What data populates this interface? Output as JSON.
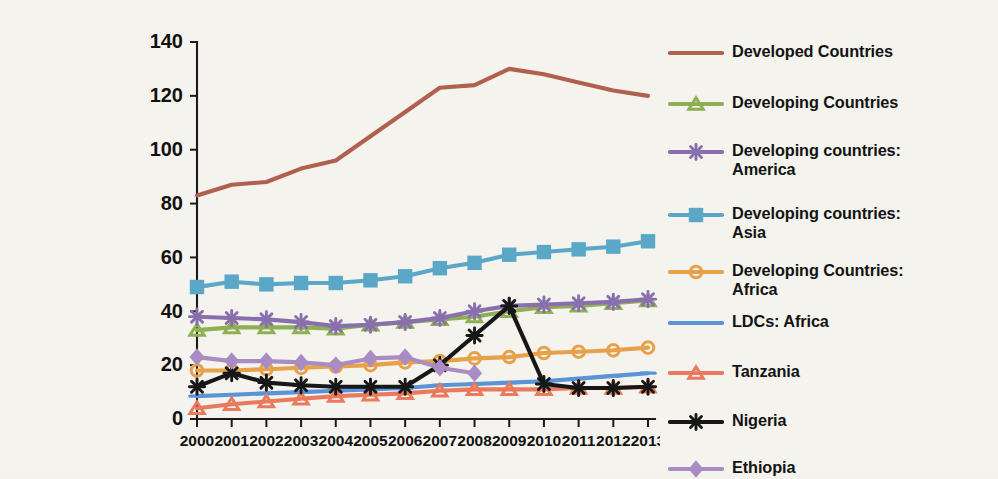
{
  "chart_data": {
    "type": "line",
    "title": "",
    "subtitle": "",
    "xlabel": "",
    "ylabel": "",
    "xlim": [
      2000,
      2013
    ],
    "ylim": [
      0,
      140
    ],
    "yticks": [
      0,
      20,
      40,
      60,
      80,
      100,
      120,
      140
    ],
    "grid": false,
    "legend_position": "right",
    "categories": [
      "2000",
      "2001",
      "2002",
      "2003",
      "2004",
      "2005",
      "2006",
      "2007",
      "2008",
      "2009",
      "2010",
      "2011",
      "2012",
      "2013"
    ],
    "series": [
      {
        "name": "Developed Countries",
        "color": "#b0604f",
        "marker": "none",
        "values": [
          83,
          87,
          88,
          93,
          96,
          105,
          114,
          123,
          124,
          130,
          128,
          125,
          122,
          120
        ]
      },
      {
        "name": "Developing Countries",
        "color": "#8faf54",
        "marker": "triangle",
        "values": [
          33,
          34,
          34,
          34,
          33.5,
          35,
          36,
          37,
          38,
          40,
          41.5,
          42,
          43,
          44
        ]
      },
      {
        "name": "Developing countries:\nAmerica",
        "color": "#8a6fae",
        "marker": "star",
        "values": [
          38,
          37.5,
          37,
          36,
          34.5,
          35,
          36,
          37.5,
          40,
          42,
          42.5,
          43,
          43.5,
          44.5
        ]
      },
      {
        "name": "Developing countries:\nAsia",
        "color": "#5aa7c8",
        "marker": "square",
        "values": [
          49,
          51,
          50,
          50.5,
          50.5,
          51.5,
          53,
          56,
          58,
          61,
          62,
          63,
          64,
          66
        ]
      },
      {
        "name": "Developing Countries:\nAfrica",
        "color": "#e6a14a",
        "marker": "circle",
        "values": [
          18,
          18,
          18.5,
          19,
          19.5,
          20,
          21,
          21.5,
          22.5,
          23,
          24.5,
          25,
          25.5,
          26.5
        ]
      },
      {
        "name": "LDCs: Africa",
        "color": "#5b94d6",
        "marker": "line",
        "values": [
          8.5,
          9,
          9.5,
          10,
          10.5,
          11,
          11.5,
          12.5,
          13,
          13.5,
          14,
          15,
          16,
          17
        ]
      },
      {
        "name": "Tanzania",
        "color": "#ea7a5d",
        "marker": "triangle",
        "values": [
          4,
          5.5,
          6.5,
          7.5,
          8.5,
          9,
          9.5,
          10.5,
          11,
          11,
          11,
          11.5,
          11.5,
          12
        ]
      },
      {
        "name": "Nigeria",
        "color": "#171717",
        "marker": "star",
        "values": [
          12,
          17,
          13.5,
          12.5,
          12,
          12,
          12,
          20,
          31,
          42,
          13,
          11.5,
          11.5,
          12
        ]
      },
      {
        "name": "Ethiopia",
        "color": "#a98cc4",
        "marker": "diamond",
        "values": [
          23,
          21.5,
          21.5,
          21,
          20,
          22.5,
          23,
          19,
          17,
          null,
          null,
          null,
          null,
          null
        ]
      }
    ]
  },
  "legend": {
    "items": [
      {
        "label": "Developed Countries"
      },
      {
        "label": "Developing Countries"
      },
      {
        "label": "Developing countries:\nAmerica"
      },
      {
        "label": "Developing countries:\nAsia"
      },
      {
        "label": "Developing Countries:\nAfrica"
      },
      {
        "label": "LDCs: Africa"
      },
      {
        "label": "Tanzania"
      },
      {
        "label": "Nigeria"
      },
      {
        "label": "Ethiopia"
      }
    ]
  },
  "axes": {
    "y_tick_labels": [
      "140",
      "120",
      "100",
      "80",
      "60",
      "40",
      "20",
      "0"
    ],
    "x_tick_labels": [
      "2000",
      "2001",
      "2002",
      "2003",
      "2004",
      "2005",
      "2006",
      "2007",
      "2008",
      "2009",
      "2010",
      "2011",
      "2012",
      "2013"
    ]
  }
}
